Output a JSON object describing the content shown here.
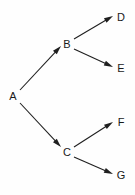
{
  "diagram": {
    "type": "directed-graph",
    "title": "",
    "background_color": "#fefefe",
    "line_color": "#1f1f1f",
    "label_color": "#1a1a1a",
    "nodes": [
      {
        "id": "A",
        "label": "A",
        "x": 13,
        "y": 96
      },
      {
        "id": "B",
        "label": "B",
        "x": 67,
        "y": 44
      },
      {
        "id": "C",
        "label": "C",
        "x": 67,
        "y": 152
      },
      {
        "id": "D",
        "label": "D",
        "x": 121,
        "y": 17
      },
      {
        "id": "E",
        "label": "E",
        "x": 121,
        "y": 68
      },
      {
        "id": "F",
        "label": "F",
        "x": 121,
        "y": 122
      },
      {
        "id": "G",
        "label": "G",
        "x": 121,
        "y": 175
      }
    ],
    "edges": [
      {
        "id": "A-B",
        "from": "A",
        "to": "B",
        "x1": 20,
        "y1": 90,
        "x2": 61,
        "y2": 46,
        "directed": true
      },
      {
        "id": "A-C",
        "from": "A",
        "to": "C",
        "x1": 20,
        "y1": 103,
        "x2": 61,
        "y2": 147,
        "directed": true
      },
      {
        "id": "B-D",
        "from": "B",
        "to": "D",
        "x1": 74,
        "y1": 39,
        "x2": 113,
        "y2": 16,
        "directed": true
      },
      {
        "id": "B-E",
        "from": "B",
        "to": "E",
        "x1": 74,
        "y1": 49,
        "x2": 113,
        "y2": 67,
        "directed": true
      },
      {
        "id": "C-F",
        "from": "C",
        "to": "F",
        "x1": 74,
        "y1": 147,
        "x2": 113,
        "y2": 122,
        "directed": true
      },
      {
        "id": "C-G",
        "from": "C",
        "to": "G",
        "x1": 74,
        "y1": 157,
        "x2": 113,
        "y2": 174,
        "directed": true
      }
    ]
  }
}
